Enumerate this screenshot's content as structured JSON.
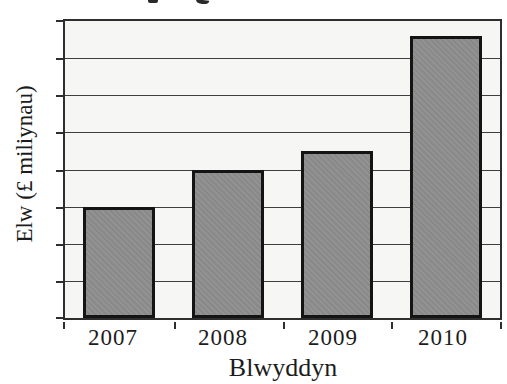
{
  "title_cropped_fragment_visible": true,
  "chart_data": {
    "type": "bar",
    "title": "",
    "categories": [
      "2007",
      "2008",
      "2009",
      "2010"
    ],
    "values": [
      3,
      4,
      4.5,
      7.6
    ],
    "value_unit": "y-axis gridline divisions (no numeric y-axis tick labels shown)",
    "xlabel": "Blwyddyn",
    "ylabel": "Elw (£ miliynau)",
    "ylim": [
      0,
      8
    ],
    "y_tick_labels": [],
    "grid": "horizontal",
    "legend": "none",
    "colors": {
      "bar_fill": "#8e8e8e",
      "bar_border": "#141414",
      "plot_background": "#f6f6f5",
      "gridline": "#3e3e3e",
      "axis": "#2e2e2e",
      "text": "#1c1c1c",
      "page_background": "#ffffff"
    }
  }
}
